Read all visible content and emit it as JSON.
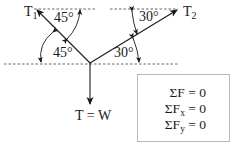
{
  "diagram": {
    "type": "free-body force diagram",
    "forces": {
      "t1": {
        "label": "T",
        "subscript": "1",
        "direction": "up-left"
      },
      "t2": {
        "label": "T",
        "subscript": "2",
        "direction": "up-right"
      },
      "weight": {
        "label": "T = W",
        "direction": "down"
      }
    },
    "angles": {
      "t1_top": "45°",
      "t1_bottom": "45°",
      "t2_top": "30°",
      "t2_bottom": "30°"
    },
    "equations": [
      {
        "lhs": "ΣF",
        "sub": "",
        "rhs": " = 0"
      },
      {
        "lhs": "ΣF",
        "sub": "x",
        "rhs": " = 0"
      },
      {
        "lhs": "ΣF",
        "sub": "y",
        "rhs": " = 0"
      }
    ],
    "colors": {
      "line": "#1a1a1a",
      "dashed": "#555555",
      "box_border": "#b8b8b8"
    }
  }
}
